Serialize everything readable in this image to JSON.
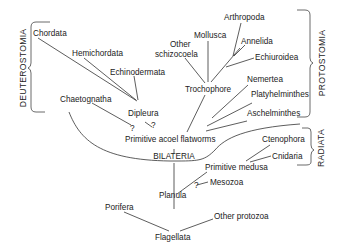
{
  "colors": {
    "line": "#333333",
    "text": "#222222",
    "background": "#ffffff"
  },
  "groups": {
    "deuterostomia": "DEUTEROSTOMIA",
    "protostomia": "PROTOSTOMIA",
    "radiata": "RADIATA",
    "bilateria": "BILATERIA"
  },
  "deuterostomes": {
    "chordata": "Chordata",
    "hemichordata": "Hemichordata",
    "echinodermata": "Echinodermata",
    "chaetognatha": "Chaetognatha",
    "dipleura": "Dipleura"
  },
  "protostomes": {
    "arthropoda": "Arthropoda",
    "mollusca": "Mollusca",
    "annelida": "Annelida",
    "other_schizocoela_line1": "Other",
    "other_schizocoela_line2": "schizocoela",
    "echiuroidea": "Echiuroidea",
    "trochophore": "Trochophore",
    "nemertea": "Nemertea",
    "platyhelminthes": "Platyhelminthes",
    "aschelminthes": "Aschelminthes"
  },
  "base": {
    "primitive_acoel_flatworms": "Primitive acoel flatworms",
    "ctenophora": "Ctenophora",
    "cnidaria": "Cnidaria",
    "primitive_medusa": "Primitive medusa",
    "planula": "Planula",
    "mesozoa": "Mesozoa",
    "porifera": "Porifera",
    "other_protozoa": "Other protozoa",
    "flagellata": "Flagellata"
  },
  "uncertain_marks": {
    "chaetognatha_link": "?",
    "dipleura_link": "?",
    "mesozoa_link": "?"
  }
}
